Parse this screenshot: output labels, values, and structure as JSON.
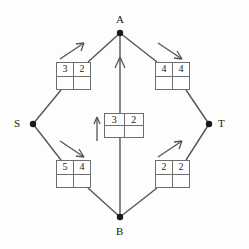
{
  "figure": {
    "type": "flow-network-diagram",
    "background_color": "#fdfdfd",
    "line_color": "#555555",
    "box_border_color": "#6e6e6e",
    "text_color": "#1a1a1a"
  },
  "nodes": [
    {
      "id": "A",
      "label": "A",
      "x": 120,
      "y": 33,
      "label_x": 116,
      "label_y": 16
    },
    {
      "id": "S",
      "label": "S",
      "x": 33,
      "y": 124,
      "label_x": 14,
      "label_y": 119
    },
    {
      "id": "T",
      "label": "T",
      "x": 209,
      "y": 124,
      "label_x": 218,
      "label_y": 119
    },
    {
      "id": "B",
      "label": "B",
      "x": 120,
      "y": 217,
      "label_x": 116,
      "label_y": 227
    }
  ],
  "edges": [
    {
      "id": "S-A",
      "from": "S",
      "to": "A",
      "direction_arrow": "up-right",
      "label_top": [
        "3",
        "2"
      ],
      "label_bottom": [
        "",
        ""
      ]
    },
    {
      "id": "A-T",
      "from": "A",
      "to": "T",
      "direction_arrow": "down-right",
      "label_top": [
        "4",
        "4"
      ],
      "label_bottom": [
        "",
        ""
      ]
    },
    {
      "id": "S-B",
      "from": "S",
      "to": "B",
      "direction_arrow": "down-right",
      "label_top": [
        "5",
        "4"
      ],
      "label_bottom": [
        "",
        ""
      ]
    },
    {
      "id": "B-T",
      "from": "B",
      "to": "T",
      "direction_arrow": "up-right",
      "label_top": [
        "2",
        "2"
      ],
      "label_bottom": [
        "",
        ""
      ]
    },
    {
      "id": "B-A",
      "from": "B",
      "to": "A",
      "direction_arrow": "up",
      "label_top": [
        "3",
        "2"
      ],
      "label_bottom": [
        "",
        ""
      ]
    }
  ],
  "boxes": {
    "top_left": {
      "x": 56,
      "y": 62,
      "w": 35,
      "h": 28,
      "cells": [
        "3",
        "2",
        "",
        ""
      ]
    },
    "top_right": {
      "x": 155,
      "y": 62,
      "w": 35,
      "h": 28,
      "cells": [
        "4",
        "4",
        "",
        ""
      ]
    },
    "center": {
      "x": 104,
      "y": 113,
      "w": 40,
      "h": 25,
      "cells": [
        "3",
        "2",
        "",
        ""
      ]
    },
    "bottom_left": {
      "x": 56,
      "y": 160,
      "w": 35,
      "h": 28,
      "cells": [
        "5",
        "4",
        "",
        ""
      ]
    },
    "bottom_right": {
      "x": 155,
      "y": 160,
      "w": 35,
      "h": 28,
      "cells": [
        "2",
        "2",
        "",
        ""
      ]
    }
  }
}
